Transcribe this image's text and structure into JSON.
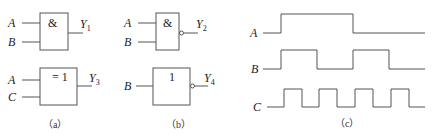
{
  "panels": {
    "a": {
      "caption": "（a）",
      "gates": [
        {
          "symbol": "&",
          "inputs": [
            "A",
            "B"
          ],
          "output": "Y",
          "output_sub": "1",
          "inverted": false
        },
        {
          "symbol": "= 1",
          "inputs": [
            "A",
            "C"
          ],
          "output": "Y",
          "output_sub": "3",
          "inverted": false
        }
      ]
    },
    "b": {
      "caption": "（b）",
      "gates": [
        {
          "symbol": "&",
          "inputs": [
            "A",
            "B"
          ],
          "output": "Y",
          "output_sub": "2",
          "inverted": true
        },
        {
          "symbol": "1",
          "inputs": [
            "B"
          ],
          "output": "Y",
          "output_sub": "4",
          "inverted": true
        }
      ]
    },
    "c": {
      "caption": "（c）",
      "waveforms": [
        {
          "name": "A",
          "transitions_x": [
            281,
            353
          ]
        },
        {
          "name": "B",
          "transitions_x": [
            281,
            317,
            353,
            389
          ]
        },
        {
          "name": "C",
          "transitions_x": [
            284,
            302,
            319,
            337,
            355,
            373,
            391,
            409
          ]
        }
      ]
    }
  }
}
